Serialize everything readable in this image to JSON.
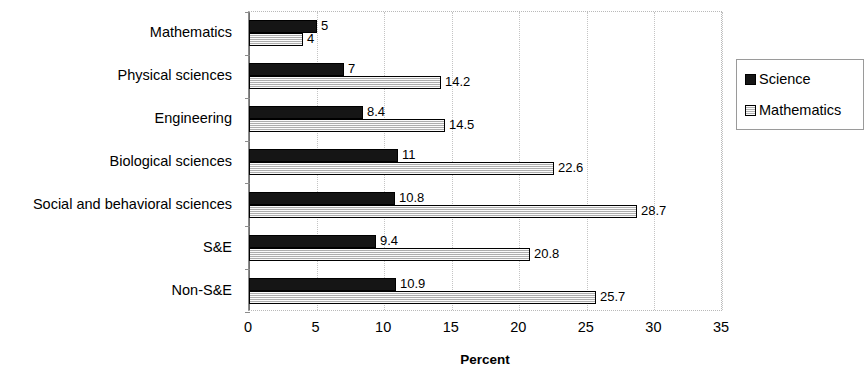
{
  "chart_data": {
    "type": "bar",
    "orientation": "horizontal",
    "title": "",
    "xlabel": "Percent",
    "ylabel": "",
    "xlim": [
      0,
      35
    ],
    "xticks": [
      0,
      5,
      10,
      15,
      20,
      25,
      30,
      35
    ],
    "grid": "vertical-dotted",
    "legend_position": "right",
    "categories": [
      "Mathematics",
      "Physical sciences",
      "Engineering",
      "Biological sciences",
      "Social and behavioral sciences",
      "S&E",
      "Non-S&E"
    ],
    "series": [
      {
        "name": "Science",
        "color": "#151515",
        "fill": "solid-black",
        "values": [
          5,
          7,
          8.4,
          11,
          10.8,
          9.4,
          10.9
        ],
        "labels": [
          "5",
          "7",
          "8.4",
          "11",
          "10.8",
          "9.4",
          "10.9"
        ]
      },
      {
        "name": "Mathematics",
        "color": "#e2e2e2",
        "fill": "light-hatched",
        "values": [
          4,
          14.2,
          14.5,
          22.6,
          28.7,
          20.8,
          25.7
        ],
        "labels": [
          "4",
          "14.2",
          "14.5",
          "22.6",
          "28.7",
          "20.8",
          "25.7"
        ]
      }
    ]
  },
  "legend": {
    "items": [
      {
        "label": "Science",
        "swatch": "science"
      },
      {
        "label": "Mathematics",
        "swatch": "mathematics"
      }
    ]
  },
  "axis": {
    "x_title": "Percent"
  }
}
